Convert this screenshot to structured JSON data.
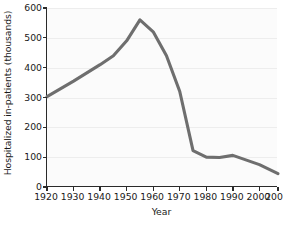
{
  "chart_data": {
    "type": "line",
    "title": "",
    "xlabel": "Year",
    "ylabel": "Hospitalized in-patients (thousands)",
    "xlim": [
      1920,
      2007
    ],
    "ylim": [
      0,
      600
    ],
    "grid": "horizontal",
    "legend": "none",
    "line_color": "#6e6e6e",
    "line_width": 3.1,
    "plot_background": "#fbfbfb",
    "axis_color": "#2a2a2a",
    "gridline_color": "#ededed",
    "xticks": [
      1920,
      1930,
      1940,
      1950,
      1960,
      1970,
      1980,
      1990,
      2000,
      2007
    ],
    "xtick_labels": [
      "1920",
      "1930",
      "1940",
      "1950",
      "1960",
      "1970",
      "1980",
      "1990",
      "2000",
      "2007"
    ],
    "yticks": [
      0,
      100,
      200,
      300,
      400,
      500,
      600
    ],
    "ytick_labels": [
      "0",
      "100",
      "200",
      "300",
      "400",
      "500",
      "600"
    ],
    "series": [
      {
        "name": "Hospitalized in-patients",
        "x": [
          1920,
          1930,
          1940,
          1945,
          1950,
          1955,
          1960,
          1965,
          1970,
          1975,
          1980,
          1985,
          1990,
          2000,
          2007
        ],
        "y": [
          303,
          355,
          410,
          440,
          490,
          560,
          520,
          440,
          320,
          122,
          100,
          99,
          106,
          75,
          45
        ]
      }
    ]
  }
}
